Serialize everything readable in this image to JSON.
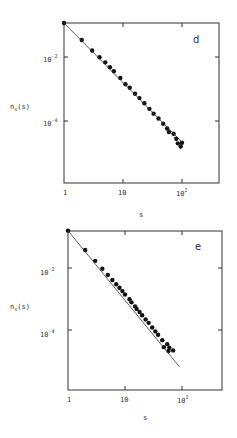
{
  "chart_data": [
    {
      "type": "scatter",
      "panel_label": "d",
      "xlabel": "s",
      "ylabel": "n_s(s)",
      "xscale": "log",
      "yscale": "log",
      "xlim": [
        1,
        400
      ],
      "ylim": [
        1e-06,
        0.115
      ],
      "x_ticks": [
        "1",
        "10",
        "10^2"
      ],
      "y_ticks": [
        "10^-2",
        "10^-4"
      ],
      "grid": false,
      "series": [
        {
          "name": "data",
          "x": [
            1,
            2,
            3,
            4,
            5,
            6,
            7,
            9,
            11,
            13,
            16,
            19,
            23,
            28,
            33,
            40,
            48,
            56,
            60,
            72,
            80,
            85,
            95,
            100
          ],
          "y": [
            0.115,
            0.034,
            0.016,
            0.0098,
            0.0068,
            0.0048,
            0.0036,
            0.0022,
            0.0014,
            0.0011,
            0.00071,
            0.00052,
            0.00036,
            0.00024,
            0.00017,
            0.00012,
            8.2e-05,
            5.8e-05,
            4.5e-05,
            4e-05,
            2.8e-05,
            2e-05,
            1.6e-05,
            2.1e-05
          ]
        },
        {
          "name": "fit",
          "type": "line",
          "x": [
            1,
            100
          ],
          "y": [
            0.115,
            2.2e-05
          ]
        }
      ]
    },
    {
      "type": "scatter",
      "panel_label": "e",
      "xlabel": "s",
      "ylabel": "n_s(s)",
      "xscale": "log",
      "yscale": "log",
      "xlim": [
        1,
        400
      ],
      "ylim": [
        8e-07,
        0.16
      ],
      "x_ticks": [
        "1",
        "10",
        "10^2"
      ],
      "y_ticks": [
        "10^-2",
        "10^-4"
      ],
      "grid": false,
      "series": [
        {
          "name": "data",
          "x": [
            1,
            2,
            3,
            4,
            5,
            6,
            7,
            8,
            9,
            10,
            12,
            13,
            15,
            16,
            18,
            20,
            23,
            26,
            30,
            34,
            38,
            45,
            48,
            55,
            58,
            60,
            70
          ],
          "y": [
            0.16,
            0.038,
            0.017,
            0.0095,
            0.006,
            0.0041,
            0.003,
            0.0023,
            0.0018,
            0.0014,
            0.00098,
            0.00078,
            0.00058,
            0.00048,
            0.00038,
            0.0003,
            0.00022,
            0.00017,
            0.00012,
            9e-05,
            7e-05,
            4.7e-05,
            2.8e-05,
            3.5e-05,
            2.1e-05,
            2.7e-05,
            2.2e-05
          ]
        },
        {
          "name": "fit",
          "type": "line",
          "x": [
            1,
            90
          ],
          "y": [
            0.16,
            6.5e-06
          ]
        }
      ]
    }
  ],
  "panels": [
    {
      "letter": "d",
      "ylabel_main": "n",
      "ylabel_sub": "s",
      "ylabel_rest": "(s)",
      "xlabel": "s",
      "yt1_base": "10",
      "yt1_exp": "-2",
      "yt2_base": "10",
      "yt2_exp": "-4",
      "xt1": "1",
      "xt2": "10",
      "xt3_base": "10",
      "xt3_exp": "2"
    },
    {
      "letter": "e",
      "ylabel_main": "n",
      "ylabel_sub": "s",
      "ylabel_rest": "(s)",
      "xlabel": "s",
      "yt1_base": "10",
      "yt1_exp": "-2",
      "yt2_base": "10",
      "yt2_exp": "-4",
      "xt1": "1",
      "xt2": "10",
      "xt3_base": "10",
      "xt3_exp": "2"
    }
  ]
}
